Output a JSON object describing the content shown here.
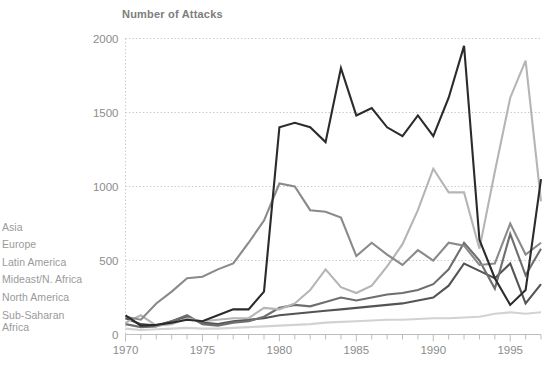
{
  "title": "Number of Attacks",
  "legend": {
    "items": [
      {
        "label": "Asia",
        "color": "#6e6e6e"
      },
      {
        "label": "Europe",
        "color": "#8a8a8a"
      },
      {
        "label": "Latin America",
        "color": "#b5b5b5"
      },
      {
        "label": "Mideast/N. Africa",
        "color": "#2b2b2b"
      },
      {
        "label": "North America",
        "color": "#545454"
      },
      {
        "label": "Sub-Saharan\nAfrica",
        "color": "#d2d2d2"
      }
    ]
  },
  "axes": {
    "y_ticks": [
      "0",
      "500",
      "1000",
      "1500",
      "2000"
    ],
    "x_ticks": [
      "1970",
      "1975",
      "1980",
      "1985",
      "1990",
      "1995"
    ]
  },
  "chart_data": {
    "type": "line",
    "title": "Number of Attacks",
    "xlabel": "",
    "ylabel": "Number of Attacks",
    "xlim": [
      1970,
      1997
    ],
    "ylim": [
      0,
      2000
    ],
    "grid": true,
    "legend_position": "left",
    "x": [
      1970,
      1971,
      1972,
      1973,
      1974,
      1975,
      1976,
      1977,
      1978,
      1979,
      1980,
      1981,
      1982,
      1983,
      1984,
      1985,
      1986,
      1987,
      1988,
      1989,
      1990,
      1991,
      1992,
      1993,
      1994,
      1995,
      1996,
      1997
    ],
    "series": [
      {
        "name": "Mideast/N. Africa",
        "color": "#2b2b2b",
        "values": [
          130,
          60,
          65,
          80,
          100,
          90,
          130,
          170,
          170,
          290,
          1400,
          1430,
          1400,
          1300,
          1800,
          1480,
          1530,
          1400,
          1340,
          1480,
          1340,
          1600,
          1950,
          640,
          380,
          200,
          300,
          1050
        ]
      },
      {
        "name": "Europe",
        "color": "#8a8a8a",
        "values": [
          120,
          100,
          210,
          290,
          380,
          390,
          440,
          480,
          620,
          770,
          1020,
          1000,
          840,
          830,
          790,
          530,
          620,
          540,
          470,
          570,
          500,
          620,
          600,
          470,
          480,
          750,
          540,
          620
        ]
      },
      {
        "name": "Latin America",
        "color": "#b5b5b5",
        "values": [
          80,
          130,
          60,
          70,
          110,
          90,
          100,
          110,
          110,
          180,
          170,
          210,
          300,
          440,
          320,
          280,
          330,
          460,
          610,
          840,
          1120,
          960,
          960,
          580,
          1100,
          1600,
          1850,
          900
        ]
      },
      {
        "name": "Asia",
        "color": "#6e6e6e",
        "values": [
          70,
          50,
          55,
          90,
          130,
          70,
          60,
          80,
          90,
          120,
          180,
          200,
          190,
          220,
          250,
          230,
          250,
          270,
          280,
          300,
          340,
          440,
          620,
          500,
          310,
          680,
          400,
          580
        ]
      },
      {
        "name": "North America",
        "color": "#545454",
        "values": [
          110,
          70,
          60,
          90,
          120,
          80,
          70,
          90,
          100,
          110,
          130,
          140,
          150,
          160,
          170,
          180,
          190,
          200,
          210,
          230,
          250,
          330,
          480,
          430,
          380,
          480,
          210,
          340
        ]
      },
      {
        "name": "Sub-Saharan Africa",
        "color": "#d2d2d2",
        "values": [
          40,
          30,
          35,
          40,
          45,
          40,
          40,
          45,
          50,
          55,
          60,
          65,
          70,
          80,
          85,
          90,
          95,
          100,
          100,
          105,
          110,
          110,
          115,
          120,
          140,
          150,
          140,
          150
        ]
      }
    ]
  }
}
